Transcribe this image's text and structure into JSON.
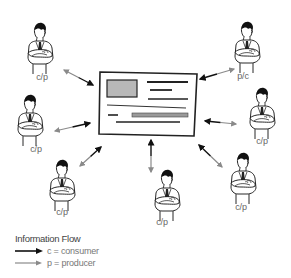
{
  "diagram": {
    "type": "information-flow",
    "center": {
      "name": "shared-document",
      "description": "document with image block and text lines"
    },
    "nodes": [
      {
        "id": "top-left",
        "label": "c/p",
        "x": 40,
        "y": 48,
        "label_x": 42,
        "label_y": 72,
        "flip": false
      },
      {
        "id": "left-middle",
        "label": "c/p",
        "x": 30,
        "y": 120,
        "label_x": 36,
        "label_y": 144,
        "flip": false
      },
      {
        "id": "bottom-left",
        "label": "c/p",
        "x": 62,
        "y": 185,
        "label_x": 62,
        "label_y": 207,
        "flip": false
      },
      {
        "id": "bottom-center",
        "label": "c/p",
        "x": 167,
        "y": 195,
        "label_x": 162,
        "label_y": 217,
        "flip": false
      },
      {
        "id": "bottom-right",
        "label": "c/p",
        "x": 243,
        "y": 178,
        "label_x": 241,
        "label_y": 202,
        "flip": false
      },
      {
        "id": "right-middle",
        "label": "c/p",
        "x": 262,
        "y": 113,
        "label_x": 262,
        "label_y": 136,
        "flip": false
      },
      {
        "id": "top-right",
        "label": "p/c",
        "x": 247,
        "y": 47,
        "label_x": 243,
        "label_y": 71,
        "flip": false
      }
    ],
    "edges": [
      {
        "from": "top-left",
        "to": "center",
        "x1": 64,
        "y1": 70,
        "x2": 93,
        "y2": 85
      },
      {
        "from": "left-middle",
        "to": "center",
        "x1": 55,
        "y1": 131,
        "x2": 90,
        "y2": 123
      },
      {
        "from": "bottom-left",
        "to": "center",
        "x1": 80,
        "y1": 166,
        "x2": 101,
        "y2": 147
      },
      {
        "from": "bottom-center",
        "to": "center",
        "x1": 151,
        "y1": 172,
        "x2": 151,
        "y2": 140
      },
      {
        "from": "bottom-right",
        "to": "center",
        "x1": 222,
        "y1": 167,
        "x2": 199,
        "y2": 145
      },
      {
        "from": "right-middle",
        "to": "center",
        "x1": 236,
        "y1": 124,
        "x2": 205,
        "y2": 121
      },
      {
        "from": "top-right",
        "to": "center",
        "x1": 234,
        "y1": 69,
        "x2": 200,
        "y2": 79
      }
    ]
  },
  "legend": {
    "title": "Information Flow",
    "items": [
      {
        "label": "c = consumer",
        "color": "#111111"
      },
      {
        "label": "p = producer",
        "color": "#888888"
      }
    ]
  },
  "colors": {
    "consumer_arrow": "#111111",
    "producer_arrow": "#8a8a8a",
    "document_image": "#b8b8b8",
    "document_border": "#222222"
  }
}
